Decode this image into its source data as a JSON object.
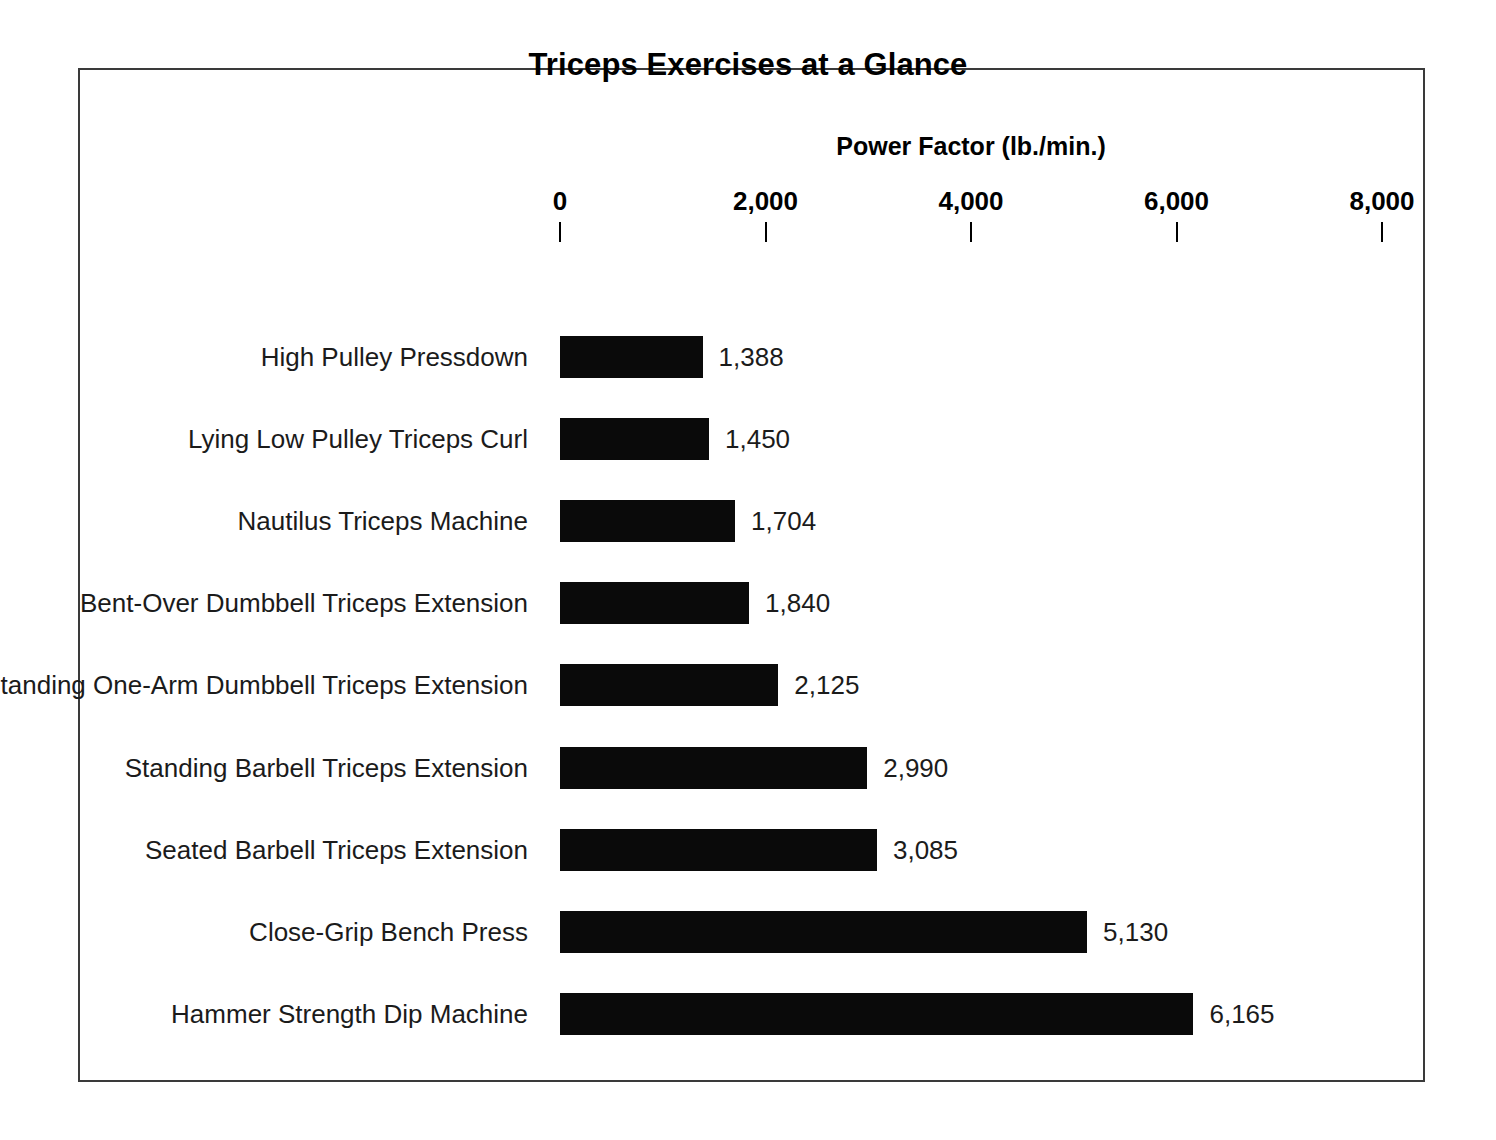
{
  "chart_data": {
    "type": "bar",
    "orientation": "horizontal",
    "title": "Triceps Exercises at a Glance",
    "xlabel": "Power Factor (lb./min.)",
    "ylabel": "",
    "xlim": [
      0,
      8000
    ],
    "xticks": [
      0,
      2000,
      4000,
      6000,
      8000
    ],
    "xtick_labels": [
      "0",
      "2,000",
      "4,000",
      "6,000",
      "8,000"
    ],
    "grid": false,
    "legend": null,
    "bar_color": "#0a0a0a",
    "categories": [
      "High Pulley Pressdown",
      "Lying Low Pulley Triceps Curl",
      "Nautilus Triceps Machine",
      "Bent-Over Dumbbell Triceps Extension",
      "Standing One-Arm Dumbbell Triceps Extension",
      "Standing Barbell Triceps Extension",
      "Seated Barbell Triceps Extension",
      "Close-Grip Bench Press",
      "Hammer Strength Dip Machine"
    ],
    "values": [
      1388,
      1450,
      1704,
      1840,
      2125,
      2990,
      3085,
      5130,
      6165
    ],
    "value_labels": [
      "1,388",
      "1,450",
      "1,704",
      "1,840",
      "2,125",
      "2,990",
      "3,085",
      "5,130",
      "6,165"
    ]
  }
}
